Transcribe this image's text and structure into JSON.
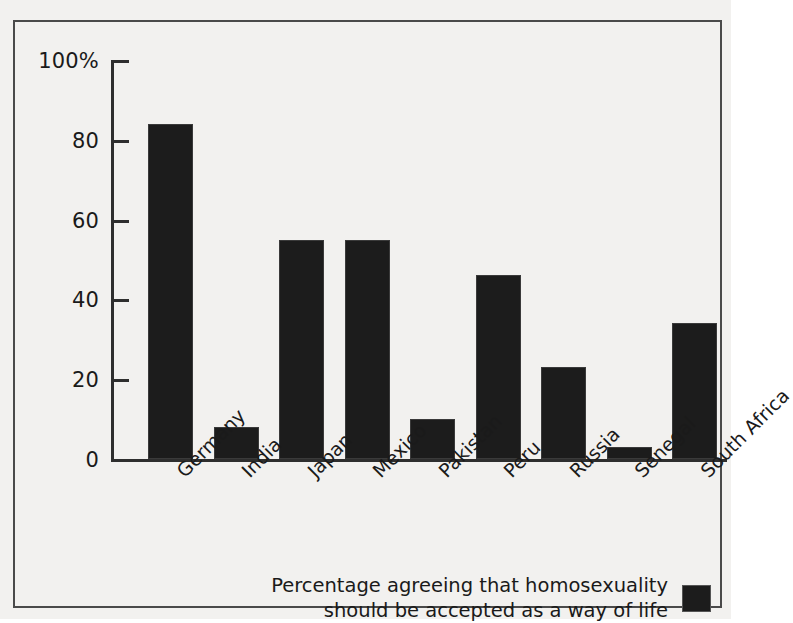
{
  "chart_data": {
    "type": "bar",
    "title": "",
    "subtitle": "",
    "xlabel": "",
    "ylabel": "",
    "ylim": [
      0,
      100
    ],
    "yticks": [
      0,
      20,
      40,
      60,
      80,
      100
    ],
    "ytick_labels": [
      "0",
      "20",
      "40",
      "60",
      "80",
      "100%"
    ],
    "grid": false,
    "legend_position": "bottom-right",
    "bar_color": "#1c1c1c",
    "background_color": "#f2f1ef",
    "axis_color": "#2e2e2e",
    "categories": [
      "Germany",
      "India",
      "Japan",
      "Mexico",
      "Pakistan",
      "Peru",
      "Russia",
      "Senegal",
      "South Africa"
    ],
    "values": [
      84,
      8,
      55,
      55,
      10,
      46,
      23,
      3,
      34
    ],
    "series": [
      {
        "name": "Percentage agreeing that homosexuality should be accepted as a way of life",
        "values": [
          84,
          8,
          55,
          55,
          10,
          46,
          23,
          3,
          34
        ]
      }
    ],
    "legend_entries": [
      {
        "label": "Percentage agreeing that homosexuality\nshould be accepted as a way of life",
        "color": "#1c1c1c"
      }
    ]
  },
  "axis": {
    "y": {
      "labels": [
        "100%",
        "80",
        "60",
        "40",
        "20",
        "0"
      ],
      "values": [
        100,
        80,
        60,
        40,
        20,
        0
      ]
    }
  },
  "legend": {
    "text": "Percentage agreeing that homosexuality\nshould be accepted as a way of life"
  }
}
